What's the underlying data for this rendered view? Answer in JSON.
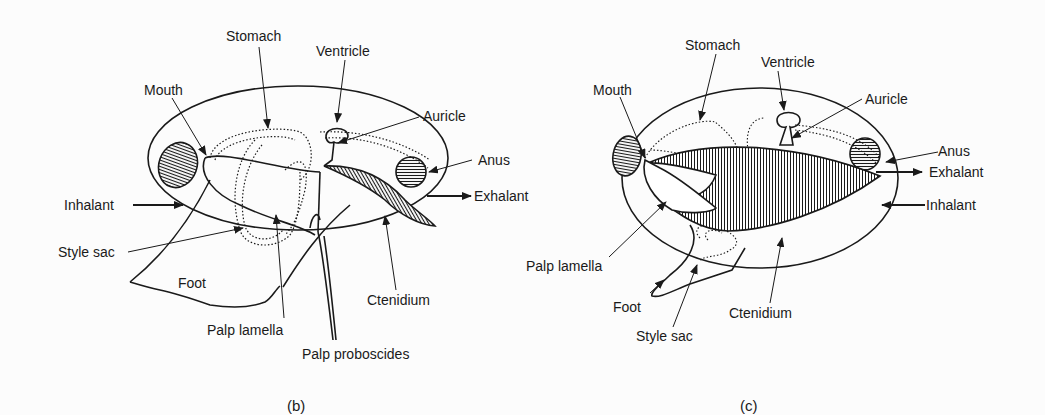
{
  "figure_b": {
    "caption": "(b)",
    "labels": {
      "stomach": "Stomach",
      "ventricle": "Ventricle",
      "mouth": "Mouth",
      "auricle": "Auricle",
      "anus": "Anus",
      "inhalant": "Inhalant",
      "exhalant": "Exhalant",
      "style_sac": "Style sac",
      "foot": "Foot",
      "ctenidium": "Ctenidium",
      "palp_lamella": "Palp lamella",
      "palp_proboscides": "Palp proboscides"
    }
  },
  "figure_c": {
    "caption": "(c)",
    "labels": {
      "stomach": "Stomach",
      "ventricle": "Ventricle",
      "mouth": "Mouth",
      "auricle": "Auricle",
      "anus": "Anus",
      "exhalant": "Exhalant",
      "inhalant": "Inhalant",
      "palp_lamella": "Palp lamella",
      "foot": "Foot",
      "ctenidium": "Ctenidium",
      "style_sac": "Style sac"
    }
  },
  "colors": {
    "background": "#fcfcfc",
    "ink": "#1a1a1a"
  }
}
